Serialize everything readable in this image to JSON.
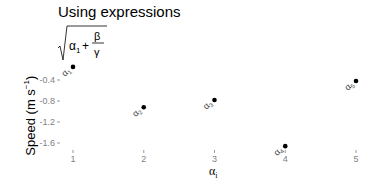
{
  "chart_data": {
    "type": "scatter",
    "title": "Using expressions",
    "subtitle": "sqrt(α1 + β/γ)",
    "xlabel": "αi",
    "ylabel": "Speed (m s^-1)",
    "x": [
      1,
      2,
      3,
      4,
      5
    ],
    "y": [
      -0.15,
      -0.92,
      -0.78,
      -1.66,
      -0.42
    ],
    "point_labels": [
      "α1",
      "α2",
      "α3",
      "α4",
      "α5"
    ],
    "xticks": [
      "1",
      "2",
      "3",
      "4",
      "5"
    ],
    "yticks": [
      "-0.4",
      "-0.8",
      "-1.2",
      "-1.6"
    ],
    "ytick_values": [
      -0.4,
      -0.8,
      -1.2,
      -1.6
    ],
    "grid": false,
    "legend": "none",
    "point_color": "#000000",
    "tick_color": "#7f7f7f"
  },
  "header": {
    "title": "Using expressions"
  }
}
